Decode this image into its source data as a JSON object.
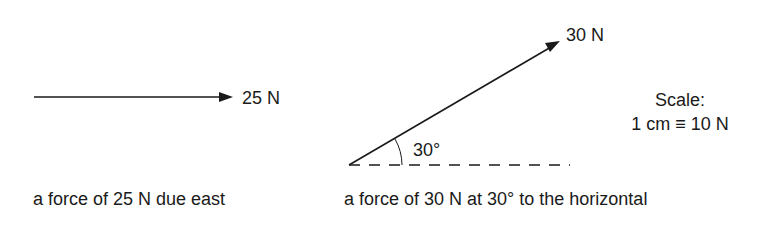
{
  "figure": {
    "left_panel": {
      "force_label": "25 N",
      "caption": "a force of 25 N due east",
      "magnitude_N": 25,
      "direction": "due east"
    },
    "right_panel": {
      "force_label": "30 N",
      "angle_label": "30°",
      "caption": "a force of 30 N at 30° to the horizontal",
      "magnitude_N": 30,
      "angle_deg": 30
    },
    "scale": {
      "title": "Scale:",
      "value": "1 cm ≡ 10 N"
    },
    "colors": {
      "line": "#1a1a1a",
      "background": "#ffffff"
    }
  }
}
